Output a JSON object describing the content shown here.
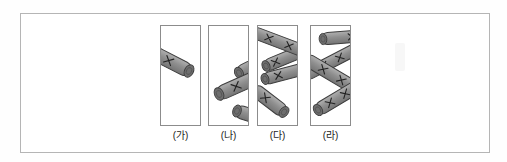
{
  "figure": {
    "background": "#ffffff",
    "frame_border_color": "#b5b5b5",
    "panel_border_color": "#8c8c8c",
    "label_color": "#1c1c1c",
    "rod_colors": {
      "body": "#8f8f8f",
      "body_light": "#b0b0b0",
      "body_dark": "#747474",
      "cap": "#6e6e6e",
      "cap_inner": "#4a4a4a",
      "outline": "#3d3d3d",
      "mark": "#222222"
    },
    "panels": [
      {
        "label": "(가)",
        "rods": [
          {
            "x1": -7,
            "y1": 27,
            "x2": 28,
            "y2": 45,
            "t": 14,
            "cap": "end",
            "marks": [
              0.42
            ]
          }
        ]
      },
      {
        "label": "(나)",
        "rods": [
          {
            "x1": 30,
            "y1": 47,
            "x2": 54,
            "y2": 35,
            "t": 13,
            "cap": "start",
            "marks": []
          },
          {
            "x1": 28,
            "y1": 85,
            "x2": 54,
            "y2": 93,
            "t": 13,
            "cap": "start",
            "marks": []
          },
          {
            "x1": 10,
            "y1": 68,
            "x2": 48,
            "y2": 51,
            "t": 14,
            "cap": "start",
            "marks": [
              0.45
            ]
          }
        ]
      },
      {
        "label": "(다)",
        "rods": [
          {
            "x1": 8,
            "y1": 40,
            "x2": 42,
            "y2": 26,
            "t": 12,
            "cap": "start",
            "marks": [
              0.28
            ]
          },
          {
            "x1": -5,
            "y1": 6,
            "x2": 45,
            "y2": 25,
            "t": 12,
            "cap": null,
            "marks": [
              0.32,
              0.72
            ]
          },
          {
            "x1": 7,
            "y1": 53,
            "x2": 45,
            "y2": 43,
            "t": 12,
            "cap": "start",
            "marks": [
              0.35
            ]
          },
          {
            "x1": -4,
            "y1": 63,
            "x2": 26,
            "y2": 86,
            "t": 13,
            "cap": "end",
            "marks": [
              0.38
            ]
          }
        ]
      },
      {
        "label": "(라)",
        "rods": [
          {
            "x1": 12,
            "y1": 13,
            "x2": 47,
            "y2": 10,
            "t": 12,
            "cap": "start",
            "marks": [
              0.82
            ]
          },
          {
            "x1": -5,
            "y1": 49,
            "x2": 47,
            "y2": 22,
            "t": 12,
            "cap": null,
            "marks": [
              0.35,
              0.65
            ]
          },
          {
            "x1": -5,
            "y1": 33,
            "x2": 47,
            "y2": 64,
            "t": 13,
            "cap": null,
            "marks": [
              0.33,
              0.68
            ]
          },
          {
            "x1": 7,
            "y1": 84,
            "x2": 47,
            "y2": 60,
            "t": 13,
            "cap": "start",
            "marks": [
              0.3,
              0.68
            ]
          }
        ]
      }
    ]
  }
}
